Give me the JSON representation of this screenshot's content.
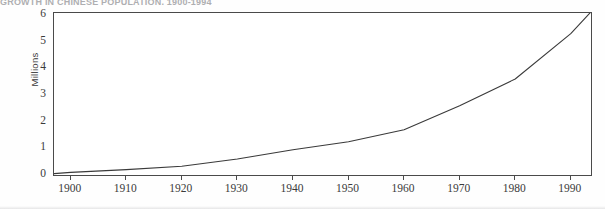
{
  "figure": {
    "clipped_title": "GROWTH IN CHINESE POPULATION, 1900-1994",
    "background_color": "#ffffff",
    "line_color": "#3a3a3a",
    "axis_color": "#4a4a4a"
  },
  "chart_data": {
    "type": "line",
    "title": "",
    "xlabel": "",
    "ylabel": "Millions",
    "xlim": [
      1897,
      1994
    ],
    "ylim": [
      0,
      6.2
    ],
    "grid": false,
    "legend": null,
    "y_ticks": [
      0,
      1,
      2,
      3,
      4,
      5,
      6
    ],
    "y_tick_labels": [
      "0",
      "1",
      "2",
      "3",
      "4",
      "5",
      "6"
    ],
    "x_ticks": [
      1900,
      1910,
      1920,
      1930,
      1940,
      1950,
      1960,
      1970,
      1980,
      1990
    ],
    "x_tick_labels": [
      "1900",
      "1910",
      "1920",
      "1930",
      "1940",
      "1950",
      "1960",
      "1970",
      "1980",
      "1990"
    ],
    "series": [
      {
        "name": "Population",
        "x": [
          1897,
          1900,
          1910,
          1920,
          1930,
          1940,
          1950,
          1960,
          1970,
          1980,
          1990,
          1994
        ],
        "values": [
          0.05,
          0.1,
          0.2,
          0.33,
          0.6,
          0.95,
          1.25,
          1.7,
          2.6,
          3.6,
          5.3,
          6.2
        ]
      }
    ]
  }
}
